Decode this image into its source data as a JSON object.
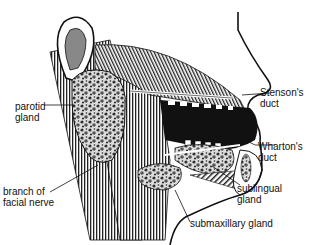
{
  "diagram": {
    "labels": {
      "parotid_1": "parotid",
      "parotid_2": "gland",
      "branch_1": "branch of",
      "branch_2": "facial nerve",
      "stenson_1": "Stenson's",
      "stenson_2": "duct",
      "wharton_1": "Wharton's",
      "wharton_2": "duct",
      "sublingual_1": "sublingual",
      "sublingual_2": "gland",
      "submaxillary": "submaxillary gland"
    },
    "colors": {
      "ink": "#111111",
      "paper": "#ffffff"
    }
  }
}
